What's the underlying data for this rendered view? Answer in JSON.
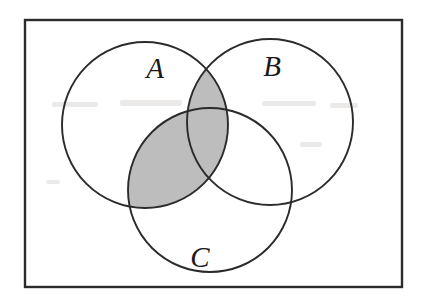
{
  "figure": {
    "name": "venn-diagram",
    "type": "three-set-venn",
    "caption_text": "",
    "background_color": "#ffffff",
    "stroke_color": "#2b2b2b",
    "shade_color": "#bdbdbd"
  },
  "universe": {
    "name": "universal-set-rectangle",
    "x": 25,
    "y": 20,
    "width": 377,
    "height": 267
  },
  "sets": [
    {
      "id": "A",
      "label": "A",
      "cx": 145,
      "cy": 125,
      "r": 83,
      "label_x": 155,
      "label_y": 78
    },
    {
      "id": "B",
      "label": "B",
      "cx": 270,
      "cy": 122,
      "r": 83,
      "label_x": 272,
      "label_y": 76
    },
    {
      "id": "C",
      "label": "C",
      "cx": 210,
      "cy": 190,
      "r": 82,
      "label_x": 200,
      "label_y": 267
    }
  ],
  "shading": {
    "expression": "A ∩ (B ∪ C)",
    "color": "#bdbdbd",
    "regions": [
      {
        "name": "a-intersect-b",
        "sets": [
          "A",
          "B"
        ],
        "shaded": true
      },
      {
        "name": "a-intersect-c",
        "sets": [
          "A",
          "C"
        ],
        "shaded": true
      },
      {
        "name": "a-intersect-b-intersect-c",
        "sets": [
          "A",
          "B",
          "C"
        ],
        "shaded": true
      },
      {
        "name": "b-intersect-c-only",
        "sets": [
          "B",
          "C"
        ],
        "shaded": false
      },
      {
        "name": "a-only",
        "sets": [
          "A"
        ],
        "shaded": false
      },
      {
        "name": "b-only",
        "sets": [
          "B"
        ],
        "shaded": false
      },
      {
        "name": "c-only",
        "sets": [
          "C"
        ],
        "shaded": false
      },
      {
        "name": "outside-all-sets",
        "sets": [],
        "shaded": false
      }
    ]
  }
}
